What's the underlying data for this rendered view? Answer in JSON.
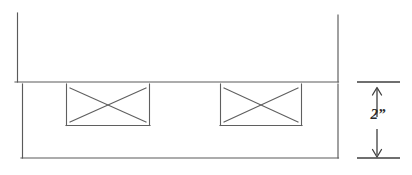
{
  "drawing": {
    "title": "Wall elevation with two X-marked openings and 2-inch vertical dimension",
    "type": "line-drawing",
    "canvas": {
      "width": 412,
      "height": 175
    },
    "stroke_color": "#555555",
    "stroke_color_dark": "#3a3a3a",
    "background_color": "#ffffff",
    "upper_panel": {
      "name": "upper-wall-panel",
      "left": 17,
      "right": 338,
      "top": 13,
      "bottom": 82,
      "top_edge_drawn": false
    },
    "lower_panel": {
      "name": "lower-band-panel",
      "left": 22,
      "right": 338,
      "top": 84,
      "bottom": 158
    },
    "openings": [
      {
        "name": "opening-left",
        "left": 66,
        "right": 150,
        "top": 84,
        "bottom": 125,
        "marker": "x-cross"
      },
      {
        "name": "opening-right",
        "left": 220,
        "right": 302,
        "top": 84,
        "bottom": 125,
        "marker": "x-cross"
      }
    ],
    "dimension": {
      "name": "vertical-dimension-2in",
      "label": "2”",
      "value": 2,
      "unit": "inch",
      "orientation": "vertical",
      "axis_x": 377,
      "extension_line_top_y": 82,
      "extension_line_bottom_y": 158,
      "extension_line_left_x": 356,
      "extension_line_right_x": 400,
      "arrow_up_from_y": 117,
      "arrow_up_to_y": 88,
      "arrow_down_from_y": 130,
      "arrow_down_to_y": 157
    }
  }
}
